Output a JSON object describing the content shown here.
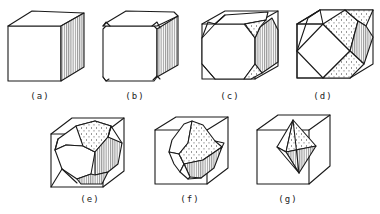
{
  "figure": {
    "colors": {
      "line": "#1a1a1a",
      "background": "#ffffff",
      "shade": "#555555"
    },
    "panels": [
      {
        "id": "a",
        "label": "(a)",
        "label_pos": [
          40,
          99
        ],
        "shape": "cube",
        "faces": [
          {
            "type": "white",
            "points": "8,26 61,26 61,81 8,81"
          },
          {
            "type": "white",
            "points": "8,26 32,11 84,13 61,26"
          },
          {
            "type": "hatch",
            "points": "61,26 84,13 84,67 61,81"
          }
        ],
        "lines": []
      },
      {
        "id": "b",
        "label": "(b)",
        "label_pos": [
          135,
          99
        ],
        "shape": "slightly truncated cube",
        "faces": [
          {
            "type": "white",
            "points": "106,26 154,26 157,29 157,77 154,81 106,81 103,77 103,29"
          },
          {
            "type": "white",
            "points": "106,23 126,11 174,12 178,16 157,26 106,26 103,26"
          },
          {
            "type": "hatch",
            "points": "157,29 178,16 178,65 157,77"
          }
        ],
        "lines": [
          "103,26 106,22 110,26",
          "152,26 157,22 160,28",
          "103,77 106,81 109,79",
          "153,80 157,76 160,79"
        ]
      },
      {
        "id": "c",
        "label": "(c)",
        "label_pos": [
          230,
          99
        ],
        "shape": "truncated cube",
        "box": [
          "202,24 255,24 255,79 202,79 202,24",
          "202,24 225,11 278,11 278,66 255,79",
          "255,24 278,11"
        ],
        "faces": [
          {
            "type": "white",
            "points": "215,24 244,24 255,38 255,64 244,79 215,79 202,64 202,38"
          },
          {
            "type": "white",
            "points": "215,24 225,15 268,12 266,20 244,24"
          },
          {
            "type": "hatch",
            "points": "260,27 272,18 278,30 278,62 262,73 255,64 255,38"
          },
          {
            "type": "dots",
            "points": "245,24 266,20 260,27 255,38"
          },
          {
            "type": "dots",
            "points": "244,79 255,64 262,73 251,79"
          }
        ],
        "lines": [
          "202,38 208,22 215,24",
          "202,64 208,71 215,79",
          "225,15 215,24"
        ]
      },
      {
        "id": "d",
        "label": "(d)",
        "label_pos": [
          323,
          99
        ],
        "shape": "cuboctahedron",
        "box": [
          "297,24 350,24 350,78 297,78 297,24",
          "297,24 320,10 373,10 373,64 350,78",
          "350,24 373,10"
        ],
        "faces": [
          {
            "type": "white",
            "points": "323,24 350,51 323,78 297,51"
          },
          {
            "type": "white",
            "points": "323,24 320,10 345,10 350,24"
          },
          {
            "type": "dots",
            "points": "323,24 345,10 358,21 350,51"
          },
          {
            "type": "dots",
            "points": "345,10 373,10 366,26 358,21"
          },
          {
            "type": "hatch",
            "points": "350,51 358,21 366,26 373,37 364,64"
          },
          {
            "type": "dots",
            "points": "323,78 350,51 364,64 350,78"
          }
        ],
        "lines": [
          "297,51 297,24 323,24",
          "297,51 297,78 323,78",
          "297,24 320,10",
          "297,51 308,18 320,10"
        ]
      },
      {
        "id": "e",
        "label": "(e)",
        "label_pos": [
          90,
          202
        ],
        "shape": "truncated octahedron",
        "box": [
          "51,134 103,134 103,187 51,187 51,134",
          "51,134 72,118 124,118 124,171 103,187",
          "103,134 124,118"
        ],
        "faces": [
          {
            "type": "white",
            "points": "58,139 76,126 95,121 111,126 108,137 95,152 83,146 66,145 55,150"
          },
          {
            "type": "white",
            "points": "55,150 66,145 83,146 95,152 91,174 77,179 62,169"
          },
          {
            "type": "dots",
            "points": "76,126 95,121 111,126 108,137 95,152 83,146"
          },
          {
            "type": "hatch",
            "points": "95,152 108,137 122,143 118,164 108,172 95,175"
          },
          {
            "type": "hatch",
            "points": "77,179 91,174 95,175 108,172 102,184 81,184"
          }
        ],
        "lines": [
          "58,139 55,150",
          "62,169 77,183",
          "108,137 111,126 122,143",
          "51,187 62,169"
        ]
      },
      {
        "id": "f",
        "label": "(f)",
        "label_pos": [
          190,
          202
        ],
        "shape": "truncated octahedron (small)",
        "box": [
          "155,130 207,130 207,184 155,184 155,130",
          "155,130 176,117 228,117 228,168 207,184",
          "207,130 228,117"
        ],
        "faces": [
          {
            "type": "white",
            "points": "172,140 184,124 192,121 188,143 179,154 169,152"
          },
          {
            "type": "white",
            "points": "169,152 179,154 184,164 180,172 174,164"
          },
          {
            "type": "dots",
            "points": "192,121 203,125 215,141 222,147 203,160 184,164 179,154 188,143"
          },
          {
            "type": "hatch",
            "points": "184,164 203,160 222,147 214,168 201,178 190,177"
          },
          {
            "type": "white",
            "points": "180,172 184,164 190,177 188,179"
          }
        ],
        "lines": [
          "222,147 224,143 215,141",
          "188,179 201,178"
        ]
      },
      {
        "id": "g",
        "label": "(g)",
        "label_pos": [
          288,
          202
        ],
        "shape": "octahedron",
        "box": [
          "257,130 309,130 309,184 257,184 257,130",
          "257,130 278,115 330,115 330,166 309,184",
          "309,130 330,115"
        ],
        "faces": [
          {
            "type": "white",
            "points": "277,147 293,120 286,152"
          },
          {
            "type": "dots",
            "points": "293,120 316,146 286,152"
          },
          {
            "type": "hatch",
            "points": "286,152 316,146 299,173"
          },
          {
            "type": "white",
            "points": "277,147 286,152 299,173"
          }
        ],
        "lines": [
          "293,120 299,173"
        ]
      }
    ]
  }
}
